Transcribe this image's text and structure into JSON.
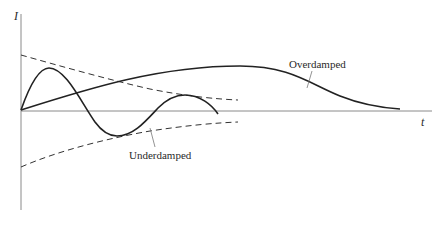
{
  "figure": {
    "y_axis_label": "I",
    "x_axis_label": "t",
    "colors": {
      "curve": "#222222",
      "axis": "#8a8a8a",
      "envelope": "#333333",
      "leader": "#777777"
    },
    "curves": [
      {
        "name": "Overdamped",
        "label": "Overdamped",
        "style": "solid"
      },
      {
        "name": "Underdamped",
        "label": "Underdamped",
        "style": "solid"
      },
      {
        "name": "Upper envelope",
        "style": "dashed"
      },
      {
        "name": "Lower envelope",
        "style": "dashed"
      }
    ]
  }
}
